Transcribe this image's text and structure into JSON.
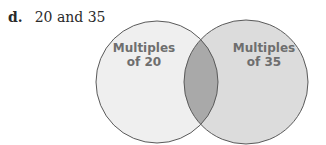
{
  "problem": {
    "letter": "d.",
    "text": "20 and 35"
  },
  "venn": {
    "left_set": {
      "line1": "Multiples",
      "line2": "of 20",
      "fill": "#efefef"
    },
    "right_set": {
      "line1": "Multiples",
      "line2": "of 35",
      "fill": "#dcdcdc"
    },
    "intersection_fill": "#a9a9a9",
    "stroke": "#5a5a5a"
  }
}
